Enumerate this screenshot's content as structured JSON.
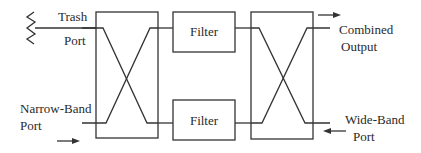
{
  "diagram": {
    "type": "block-diagram",
    "colors": {
      "line": "#333333",
      "text": "#2a2a2a",
      "background": "#ffffff"
    },
    "labels": {
      "trash_port_1": "Trash",
      "trash_port_2": "Port",
      "narrow_band_1": "Narrow-Band",
      "narrow_band_2": "Port",
      "combined_1": "Combined",
      "combined_2": "Output",
      "wide_band_1": "Wide-Band",
      "wide_band_2": "Port"
    },
    "blocks": {
      "filter_top": "Filter",
      "filter_bottom": "Filter",
      "hybrid_left": "",
      "hybrid_right": ""
    },
    "icons": {
      "trash_port_termination": "resistor-termination-icon",
      "narrow_band_input": "arrow-right-icon",
      "combined_output": "arrow-right-icon",
      "wide_band_input": "arrow-left-icon"
    }
  }
}
